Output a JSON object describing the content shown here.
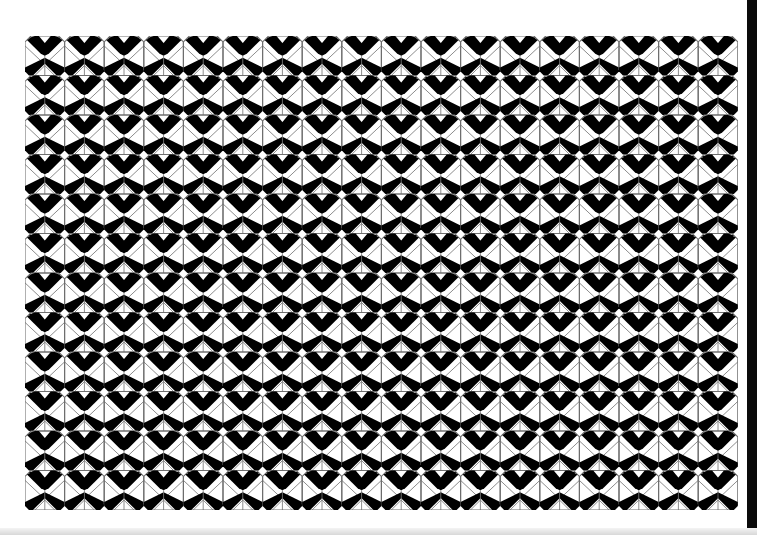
{
  "image": {
    "description": "Black and white geometric tile pattern of interlocking X / V shapes",
    "background_color": "#ffffff",
    "ink_color": "#000000",
    "outline_color": "#6e6e6e",
    "edge_bar_color": "#0a0a0a"
  },
  "pattern": {
    "columns": 18,
    "rows": 12,
    "tile_width": 39.6,
    "tile_height": 39.5,
    "origin_x": 25,
    "origin_y": 36,
    "motif": "x-chevron-tile"
  }
}
